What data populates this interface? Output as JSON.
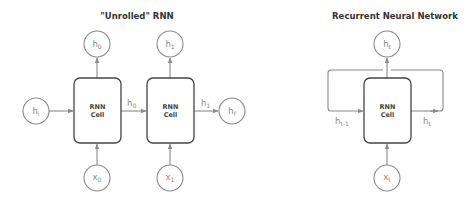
{
  "left_diagram": {
    "title": "\"Unrolled\" RNN",
    "cells": [
      {
        "line1": "RNN",
        "line2": "Cell"
      },
      {
        "line1": "RNN",
        "line2": "Cell"
      }
    ],
    "outputs": [
      {
        "base": "h",
        "sub": "0"
      },
      {
        "base": "h",
        "sub": "1"
      }
    ],
    "inputs": [
      {
        "base": "x",
        "sub": "0"
      },
      {
        "base": "x",
        "sub": "1"
      }
    ],
    "initial_state": {
      "base": "h",
      "sub": "i"
    },
    "final_state": {
      "base": "h",
      "sub": "f"
    },
    "edge_labels": [
      {
        "base": "h",
        "sub": "0"
      },
      {
        "base": "h",
        "sub": "1"
      }
    ]
  },
  "right_diagram": {
    "title": "Recurrent Neural Network",
    "cell": {
      "line1": "RNN",
      "line2": "Cell"
    },
    "output": {
      "base": "h",
      "sub": "t"
    },
    "input": {
      "base": "x",
      "sub": "t"
    },
    "edge_labels": {
      "incoming": {
        "base": "h",
        "sub": "t-1"
      },
      "outgoing": {
        "base": "h",
        "sub": "t"
      }
    }
  },
  "colors": {
    "node_stroke": "#8a8a8a",
    "cell_stroke": "#444444",
    "title": "#333333"
  }
}
